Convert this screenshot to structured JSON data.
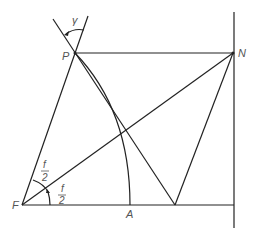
{
  "diagram": {
    "labels": {
      "gamma": "γ",
      "P": "P",
      "N": "N",
      "F": "F",
      "A": "A",
      "half_angle_upper_num": "f",
      "half_angle_upper_den": "2",
      "half_angle_lower_num": "f",
      "half_angle_lower_den": "2"
    },
    "colors": {
      "line": "#222222",
      "label": "#555555",
      "background": "#ffffff"
    }
  }
}
